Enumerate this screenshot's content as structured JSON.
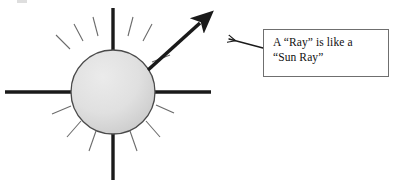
{
  "canvas": {
    "width": 396,
    "height": 186,
    "background": "#ffffff"
  },
  "colors": {
    "ray_thick": "#1a1a1a",
    "ray_thin": "#6b6b6b",
    "sun_fill_light": "#e6e6e6",
    "sun_fill_dark": "#cbcbcb",
    "sun_stroke": "#4a4a4a",
    "box_border": "#6f6f6f",
    "box_fill": "#ffffff",
    "text": "#111111",
    "arrow": "#1a1a1a"
  },
  "diagram": {
    "sun": {
      "label": "sun-circle",
      "center_x": 113,
      "center_y": 92,
      "radius": 42
    },
    "thick_rays": [
      {
        "name": "ray-up",
        "x1": 113,
        "y1": 8,
        "x2": 113,
        "y2": 52
      },
      {
        "name": "ray-down",
        "x1": 113,
        "y1": 132,
        "x2": 113,
        "y2": 180
      },
      {
        "name": "ray-left",
        "x1": 5,
        "y1": 92,
        "x2": 73,
        "y2": 92
      },
      {
        "name": "ray-right",
        "x1": 153,
        "y1": 92,
        "x2": 211,
        "y2": 92
      }
    ],
    "thin_rays": [
      {
        "name": "thin-ray-1",
        "x1": 70,
        "y1": 49,
        "x2": 56,
        "y2": 35
      },
      {
        "name": "thin-ray-2",
        "x1": 83,
        "y1": 41,
        "x2": 74,
        "y2": 24
      },
      {
        "name": "thin-ray-3",
        "x1": 98,
        "y1": 36,
        "x2": 93,
        "y2": 17
      },
      {
        "name": "thin-ray-4",
        "x1": 128,
        "y1": 36,
        "x2": 133,
        "y2": 17
      },
      {
        "name": "thin-ray-5",
        "x1": 143,
        "y1": 41,
        "x2": 152,
        "y2": 24
      },
      {
        "name": "thin-ray-6",
        "x1": 152,
        "y1": 62,
        "x2": 170,
        "y2": 55
      },
      {
        "name": "thin-ray-7",
        "x1": 156,
        "y1": 105,
        "x2": 174,
        "y2": 113
      },
      {
        "name": "thin-ray-8",
        "x1": 146,
        "y1": 121,
        "x2": 160,
        "y2": 137
      },
      {
        "name": "thin-ray-9",
        "x1": 130,
        "y1": 131,
        "x2": 137,
        "y2": 151
      },
      {
        "name": "thin-ray-10",
        "x1": 96,
        "y1": 131,
        "x2": 89,
        "y2": 151
      },
      {
        "name": "thin-ray-11",
        "x1": 81,
        "y1": 121,
        "x2": 67,
        "y2": 137
      },
      {
        "name": "thin-ray-12",
        "x1": 71,
        "y1": 106,
        "x2": 52,
        "y2": 114
      }
    ],
    "pointer_ray": {
      "name": "ray-arrow",
      "x1": 148,
      "y1": 70,
      "x2": 205,
      "y2": 18
    }
  },
  "callout": {
    "label": "callout-box",
    "text": "A “Ray” is like a\n“Sun Ray”",
    "box": {
      "x": 263,
      "y": 29,
      "width": 126,
      "height": 48
    },
    "leader_arrow": {
      "name": "callout-leader-arrow",
      "x1": 263,
      "y1": 48,
      "x2": 227,
      "y2": 39
    }
  }
}
